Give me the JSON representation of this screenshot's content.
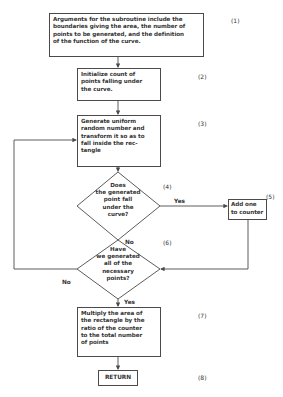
{
  "flowchart": {
    "nodes": {
      "args": {
        "step": "(1)",
        "text": "Arguments for the subroutine include the\nboundaries giving the area, the number of\npoints to be generated, and the definition\nof the function of the curve."
      },
      "init": {
        "step": "(2)",
        "text": "Initialize count of\npoints falling under\nthe curve."
      },
      "generate": {
        "step": "(3)",
        "text": "Generate uniform\nrandom number and\ntransform it so as to\nfall inside the rec-\ntangle"
      },
      "under_curve": {
        "step": "(4)",
        "text": "Does\nthe generated\npoint fall\nunder the\ncurve?"
      },
      "add_one": {
        "step": "(5)",
        "text": "Add one\nto counter"
      },
      "all_generated": {
        "step": "(6)",
        "text": "Have\nwe generated\nall of the\nnecessary\npoints?"
      },
      "multiply": {
        "step": "(7)",
        "text": "Multiply the area of\nthe rectangle by the\nratio of the counter\nto the total number\nof points"
      },
      "return": {
        "step": "(8)",
        "text": "RETURN"
      }
    },
    "edges": {
      "under_curve_yes": "Yes",
      "under_curve_no": "No",
      "all_generated_no": "No",
      "all_generated_yes": "Yes"
    },
    "colors": {
      "line": "#4a4a4a",
      "background": "#ffffff"
    }
  }
}
